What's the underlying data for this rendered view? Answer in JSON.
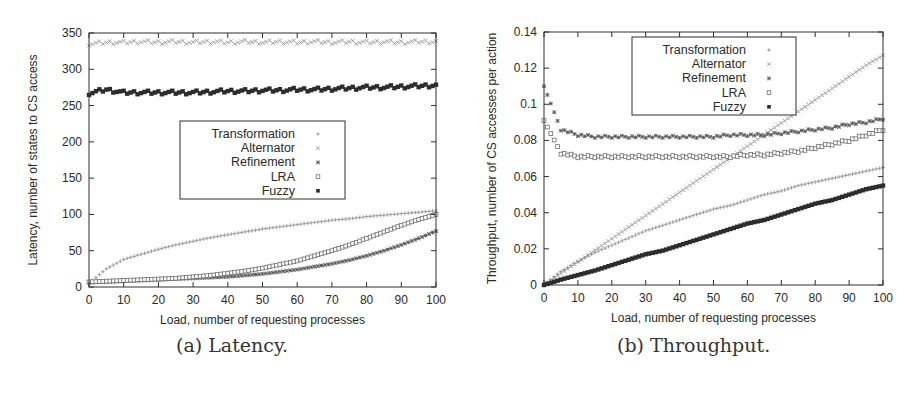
{
  "figure": {
    "captions": [
      "(a) Latency.",
      "(b) Throughput."
    ]
  },
  "chart_data": [
    {
      "type": "scatter",
      "title": "(a) Latency.",
      "xlabel": "Load, number of requesting processes",
      "ylabel": "Latency, number of states to CS access",
      "xlim": [
        0,
        100
      ],
      "ylim": [
        0,
        350
      ],
      "xticks": [
        0,
        10,
        20,
        30,
        40,
        50,
        60,
        70,
        80,
        90,
        100
      ],
      "yticks": [
        0,
        50,
        100,
        150,
        200,
        250,
        300,
        350
      ],
      "grid": false,
      "legend_position": "center",
      "legend": [
        "Transformation",
        "Alternator",
        "Refinement",
        "LRA",
        "Fuzzy"
      ],
      "x": [
        0,
        5,
        10,
        15,
        20,
        25,
        30,
        35,
        40,
        45,
        50,
        55,
        60,
        65,
        70,
        75,
        80,
        85,
        90,
        95,
        100
      ],
      "series": [
        {
          "name": "Transformation",
          "marker": "plus",
          "values": [
            5,
            25,
            38,
            45,
            52,
            58,
            63,
            68,
            72,
            76,
            80,
            83,
            86,
            89,
            92,
            94,
            97,
            99,
            101,
            103,
            105
          ]
        },
        {
          "name": "Alternator",
          "marker": "cross",
          "values": [
            335,
            337,
            337,
            338,
            337,
            338,
            337,
            338,
            337,
            338,
            337,
            338,
            337,
            338,
            337,
            338,
            337,
            338,
            337,
            338,
            338
          ]
        },
        {
          "name": "Refinement",
          "marker": "star",
          "values": [
            6,
            7,
            8,
            9,
            10,
            11,
            12,
            13,
            14,
            16,
            18,
            21,
            24,
            28,
            32,
            37,
            43,
            50,
            58,
            67,
            77
          ]
        },
        {
          "name": "LRA",
          "marker": "open-square",
          "values": [
            7,
            8,
            9,
            10,
            11,
            12,
            14,
            16,
            19,
            22,
            26,
            31,
            36,
            43,
            50,
            58,
            67,
            76,
            85,
            93,
            100
          ]
        },
        {
          "name": "Fuzzy",
          "marker": "filled-square",
          "values": [
            267,
            272,
            268,
            268,
            268,
            268,
            268,
            269,
            270,
            270,
            271,
            271,
            272,
            272,
            273,
            274,
            275,
            275,
            276,
            277,
            278
          ]
        }
      ],
      "frame": {
        "x0": 89,
        "x1": 436,
        "y0": 287,
        "y1": 33
      },
      "legend_box": {
        "x": 180,
        "y": 121,
        "w": 165,
        "h": 78
      }
    },
    {
      "type": "scatter",
      "title": "(b) Throughput.",
      "xlabel": "Load, number of requesting processes",
      "ylabel": "Throughput, number of CS accesses per action",
      "xlim": [
        0,
        100
      ],
      "ylim": [
        0,
        0.14
      ],
      "xticks": [
        0,
        10,
        20,
        30,
        40,
        50,
        60,
        70,
        80,
        90,
        100
      ],
      "yticks": [
        0,
        0.02,
        0.04,
        0.06,
        0.08,
        0.1,
        0.12,
        0.14
      ],
      "grid": false,
      "legend_position": "upper center",
      "legend": [
        "Transformation",
        "Alternator",
        "Refinement",
        "LRA",
        "Fuzzy"
      ],
      "x": [
        0,
        5,
        10,
        15,
        20,
        25,
        30,
        35,
        40,
        45,
        50,
        55,
        60,
        65,
        70,
        75,
        80,
        85,
        90,
        95,
        100
      ],
      "series": [
        {
          "name": "Transformation",
          "marker": "plus",
          "values": [
            0.0,
            0.0075,
            0.013,
            0.018,
            0.022,
            0.026,
            0.03,
            0.033,
            0.036,
            0.039,
            0.042,
            0.044,
            0.047,
            0.05,
            0.052,
            0.055,
            0.057,
            0.059,
            0.061,
            0.063,
            0.065
          ]
        },
        {
          "name": "Alternator",
          "marker": "cross",
          "values": [
            0.0,
            0.0064,
            0.0128,
            0.0192,
            0.0256,
            0.032,
            0.0384,
            0.0448,
            0.0512,
            0.0576,
            0.064,
            0.0704,
            0.0768,
            0.0832,
            0.0896,
            0.096,
            0.1024,
            0.1088,
            0.1152,
            0.1216,
            0.127
          ]
        },
        {
          "name": "Refinement",
          "marker": "star",
          "values": [
            0.11,
            0.086,
            0.083,
            0.082,
            0.082,
            0.082,
            0.082,
            0.082,
            0.082,
            0.082,
            0.082,
            0.083,
            0.083,
            0.083,
            0.084,
            0.085,
            0.086,
            0.087,
            0.089,
            0.09,
            0.092
          ]
        },
        {
          "name": "LRA",
          "marker": "open-square",
          "values": [
            0.091,
            0.073,
            0.071,
            0.071,
            0.071,
            0.071,
            0.071,
            0.071,
            0.071,
            0.071,
            0.071,
            0.071,
            0.072,
            0.072,
            0.073,
            0.074,
            0.076,
            0.078,
            0.08,
            0.083,
            0.086
          ]
        },
        {
          "name": "Fuzzy",
          "marker": "filled-square",
          "values": [
            0.0,
            0.003,
            0.0055,
            0.008,
            0.011,
            0.014,
            0.017,
            0.019,
            0.022,
            0.025,
            0.028,
            0.031,
            0.034,
            0.036,
            0.039,
            0.042,
            0.045,
            0.047,
            0.05,
            0.053,
            0.055
          ]
        }
      ],
      "frame": {
        "x0": 544,
        "x1": 883,
        "y0": 285,
        "y1": 32
      },
      "legend_box": {
        "x": 632,
        "y": 37,
        "w": 164,
        "h": 78
      }
    }
  ],
  "colors": {
    "axis": "#2e2e2e",
    "transformation": "#8a8a8a",
    "alternator": "#8a8a8a",
    "refinement": "#555555",
    "lra": "#6e6e6e",
    "fuzzy": "#2c2c2c"
  }
}
